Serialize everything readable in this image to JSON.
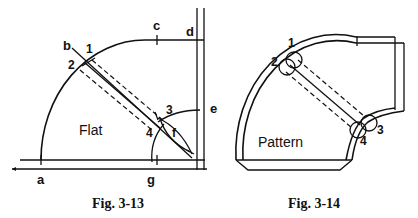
{
  "figures": [
    {
      "id": "fig-3-13",
      "caption": "Fig. 3-13",
      "region_label": "Flat",
      "point_labels": {
        "a": "a",
        "b": "b",
        "c": "c",
        "d": "d",
        "e": "e",
        "f": "f",
        "g": "g"
      },
      "number_labels": {
        "n1": "1",
        "n2": "2",
        "n3": "3",
        "n4": "4"
      }
    },
    {
      "id": "fig-3-14",
      "caption": "Fig. 3-14",
      "region_label": "Pattern",
      "number_labels": {
        "n1": "1",
        "n2": "2",
        "n3": "3",
        "n4": "4"
      }
    }
  ]
}
